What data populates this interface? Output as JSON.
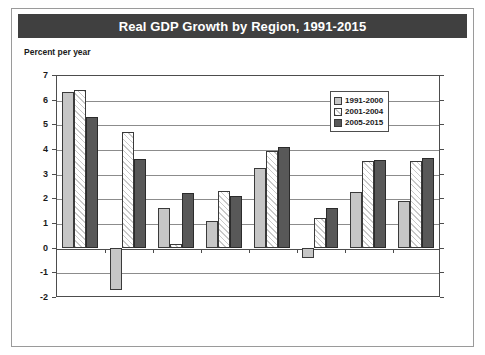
{
  "figure": {
    "title": "Real GDP Growth by Region, 1991-2015",
    "subtitle": "Percent per year",
    "title_bar_color": "#404040",
    "title_text_color": "#ffffff"
  },
  "legend": {
    "position": "top-right-inside",
    "entries": [
      {
        "label": "1991-2000",
        "swatch": "light-gray-solid",
        "color": "#c6c6c6"
      },
      {
        "label": "2001-2004",
        "swatch": "white-diagonal-hatch",
        "color": "#ffffff"
      },
      {
        "label": "2005-2015",
        "swatch": "dark-gray-solid",
        "color": "#585858"
      }
    ]
  },
  "chart_data": {
    "type": "bar",
    "title": "Real GDP Growth by Region, 1991-2015",
    "subtitle": "Percent per year",
    "xlabel": "",
    "ylabel": "Percent per year",
    "ylim": [
      -2,
      7
    ],
    "ytick_step": 1,
    "yticks": [
      7,
      6,
      5,
      4,
      3,
      2,
      1,
      0,
      -1,
      -2
    ],
    "ytick_labels": [
      "7",
      "6",
      "5",
      "4",
      "3",
      "2",
      "1",
      "0",
      "-1",
      "-2"
    ],
    "grid": true,
    "legend_position": "upper right",
    "categories": [
      "East Asia\n& Pacific",
      "Europe &\nCentral\nAsia",
      "Latin\nAmerica &\nCaribbean",
      "Middle\nEast &\nNorth\nAfrica",
      "South Asia",
      "Sub-\nSaharan\nAfrica",
      "Low-\nincome\ncountries",
      "Middle-\nincome\ncountries"
    ],
    "category_labels_flat": [
      "East Asia & Pacific",
      "Europe & Central Asia",
      "Latin America & Caribbean",
      "Middle East & North Africa",
      "South Asia",
      "Sub-Saharan Africa",
      "Low-income countries",
      "Middle-income countries"
    ],
    "series": [
      {
        "name": "1991-2000",
        "color": "#c6c6c6",
        "pattern": "solid",
        "values": [
          6.3,
          -1.7,
          1.6,
          1.1,
          3.25,
          -0.4,
          2.25,
          1.9
        ]
      },
      {
        "name": "2001-2004",
        "color": "#ffffff",
        "pattern": "diagonal-hatch",
        "values": [
          6.4,
          4.7,
          0.15,
          2.3,
          3.9,
          1.2,
          3.5,
          3.5
        ]
      },
      {
        "name": "2005-2015",
        "color": "#585858",
        "pattern": "solid",
        "values": [
          5.3,
          3.6,
          2.2,
          2.1,
          4.1,
          1.6,
          3.55,
          3.65
        ]
      }
    ]
  }
}
